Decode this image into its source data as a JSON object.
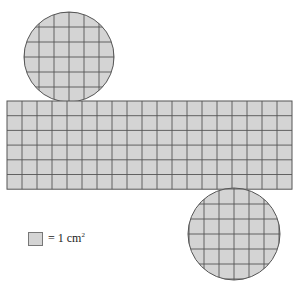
{
  "diagram": {
    "fill_color": "#d4d4d4",
    "line_color": "#555555",
    "top_circle": {
      "cx": 69,
      "cy": 57,
      "r": 45
    },
    "rectangle": {
      "x": 7,
      "y": 101,
      "cols": 19,
      "rows": 6,
      "cell_w": 15,
      "cell_h": 14.7
    },
    "bottom_circle": {
      "cx": 234,
      "cy": 234,
      "r": 46
    },
    "grid_size": 15
  },
  "legend": {
    "text": "= 1 cm",
    "superscript": "2"
  }
}
